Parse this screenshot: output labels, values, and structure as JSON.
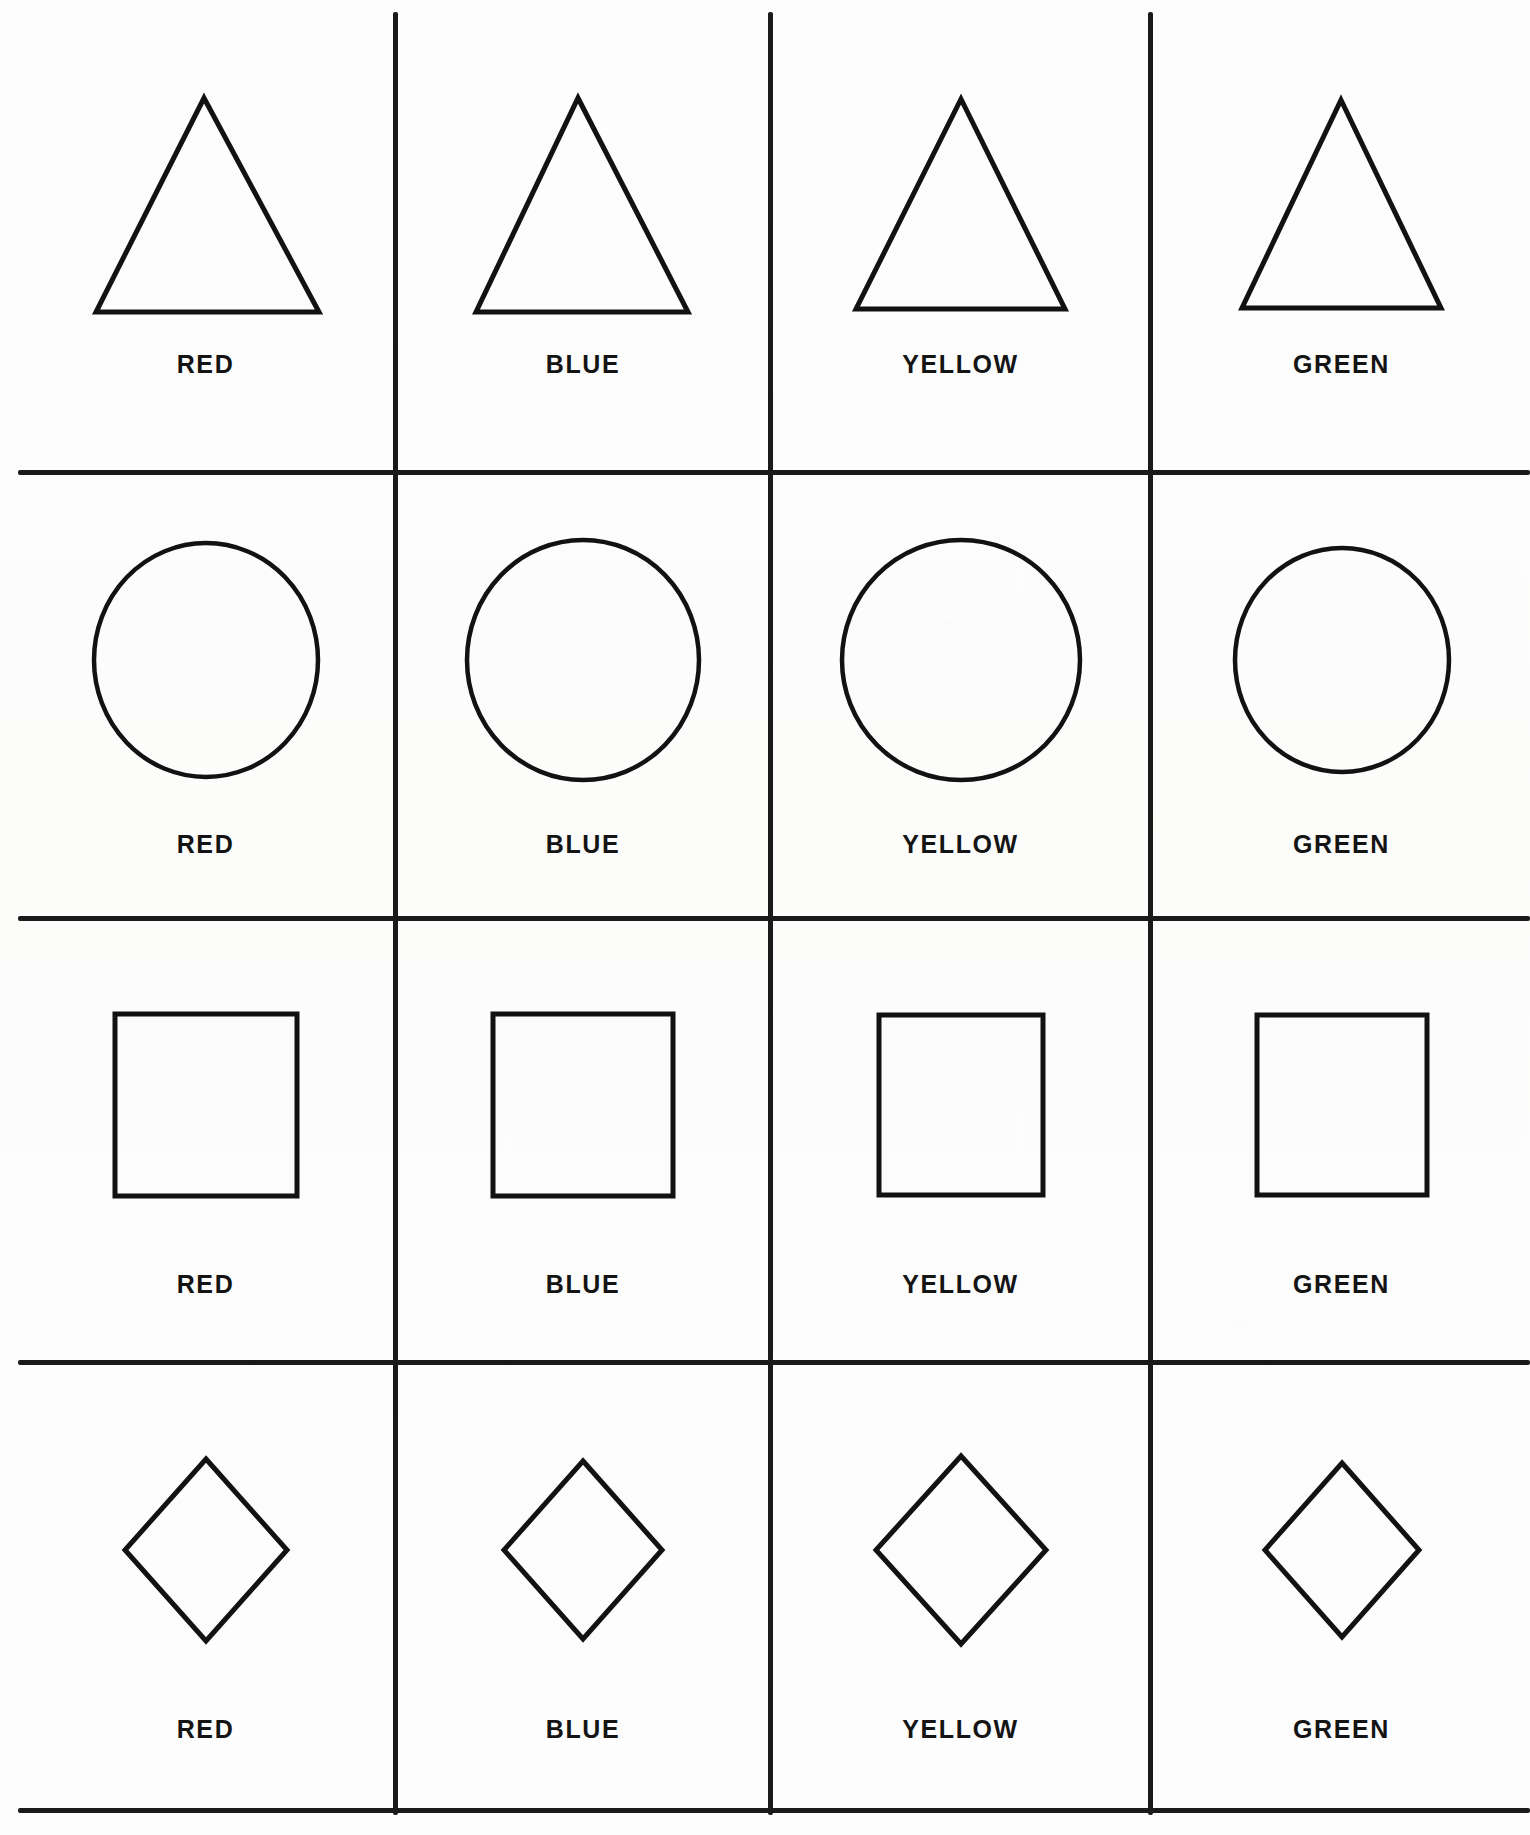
{
  "page": {
    "background_color": "#fdfdfd",
    "ink_color": "#121212",
    "columns": 4,
    "rows": 4
  },
  "column_labels": [
    "RED",
    "BLUE",
    "YELLOW",
    "GREEN"
  ],
  "rows": [
    {
      "shape": "triangle",
      "shape_icon": "triangle-outline-icon",
      "cells": [
        {
          "label": "RED",
          "shape": "triangle"
        },
        {
          "label": "BLUE",
          "shape": "triangle"
        },
        {
          "label": "YELLOW",
          "shape": "triangle"
        },
        {
          "label": "GREEN",
          "shape": "triangle"
        }
      ]
    },
    {
      "shape": "circle",
      "shape_icon": "circle-outline-icon",
      "cells": [
        {
          "label": "RED",
          "shape": "circle"
        },
        {
          "label": "BLUE",
          "shape": "circle"
        },
        {
          "label": "YELLOW",
          "shape": "circle"
        },
        {
          "label": "GREEN",
          "shape": "circle"
        }
      ]
    },
    {
      "shape": "square",
      "shape_icon": "square-outline-icon",
      "cells": [
        {
          "label": "RED",
          "shape": "square"
        },
        {
          "label": "BLUE",
          "shape": "square"
        },
        {
          "label": "YELLOW",
          "shape": "square"
        },
        {
          "label": "GREEN",
          "shape": "square"
        }
      ]
    },
    {
      "shape": "diamond",
      "shape_icon": "diamond-outline-icon",
      "cells": [
        {
          "label": "RED",
          "shape": "diamond"
        },
        {
          "label": "BLUE",
          "shape": "diamond"
        },
        {
          "label": "YELLOW",
          "shape": "diamond"
        },
        {
          "label": "GREEN",
          "shape": "diamond"
        }
      ]
    }
  ]
}
